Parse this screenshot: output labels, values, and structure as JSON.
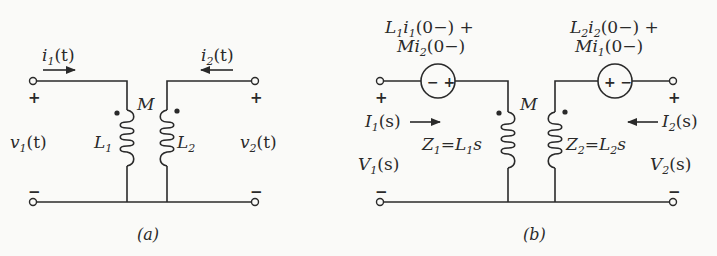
{
  "diagram_a": {
    "caption": "(a)",
    "current_left": {
      "base": "i",
      "sub": "1",
      "rest": "(t)"
    },
    "current_right": {
      "base": "i",
      "sub": "2",
      "rest": "(t)"
    },
    "voltage_left": {
      "base": "v",
      "sub": "1",
      "rest": "(t)"
    },
    "voltage_right": {
      "base": "v",
      "sub": "2",
      "rest": "(t)"
    },
    "inductor_left": {
      "base": "L",
      "sub": "1"
    },
    "inductor_right": {
      "base": "L",
      "sub": "2"
    },
    "mutual": "M",
    "plus": "+",
    "minus": "−"
  },
  "diagram_b": {
    "caption": "(b)",
    "source_left_label_line1": {
      "a": "L",
      "a_sub": "1",
      "b": "i",
      "b_sub": "1",
      "rest": "(0−) +"
    },
    "source_left_label_line2": {
      "a": "Mi",
      "a_sub": "2",
      "rest": "(0−)"
    },
    "source_right_label_line1": {
      "a": "L",
      "a_sub": "2",
      "b": "i",
      "b_sub": "2",
      "rest": "(0−) +"
    },
    "source_right_label_line2": {
      "a": "Mi",
      "a_sub": "1",
      "rest": "(0−)"
    },
    "source_left_polarity": "− +",
    "source_right_polarity": "+ −",
    "current_left": {
      "base": "I",
      "sub": "1",
      "rest": "(s)"
    },
    "current_right": {
      "base": "I",
      "sub": "2",
      "rest": "(s)"
    },
    "voltage_left": {
      "base": "V",
      "sub": "1",
      "rest": "(s)"
    },
    "voltage_right": {
      "base": "V",
      "sub": "2",
      "rest": "(s)"
    },
    "impedance_left": {
      "z": "Z",
      "z_sub": "1",
      "eq": "=",
      "l": "L",
      "l_sub": "1",
      "s": "s"
    },
    "impedance_right": {
      "z": "Z",
      "z_sub": "2",
      "eq": "=",
      "l": "L",
      "l_sub": "2",
      "s": "s"
    },
    "mutual": "M",
    "plus": "+",
    "minus": "−"
  }
}
